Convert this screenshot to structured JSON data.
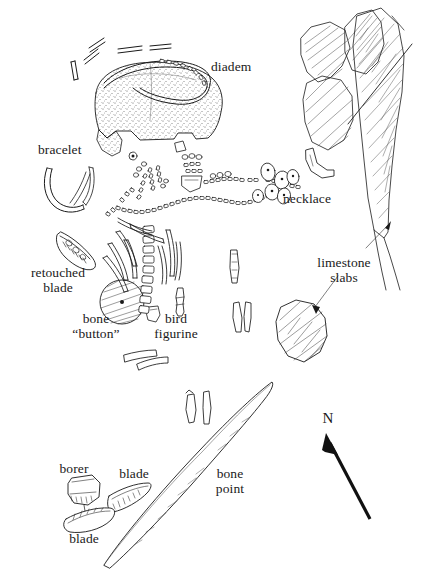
{
  "figure": {
    "type": "archaeological-site-plan",
    "background_color": "#ffffff",
    "ink_color": "#1a1a1a"
  },
  "labels": [
    {
      "id": "diadem",
      "text": "diadem",
      "x": 211,
      "y": 66,
      "align": "left"
    },
    {
      "id": "bracelet",
      "text": "bracelet",
      "x": 38,
      "y": 149,
      "align": "left"
    },
    {
      "id": "necklace",
      "text": "necklace",
      "x": 283,
      "y": 198,
      "align": "left"
    },
    {
      "id": "retouched",
      "text": "retouched\nblade",
      "x": 58,
      "y": 272,
      "align": "center"
    },
    {
      "id": "limestone",
      "text": "limestone\nslabs",
      "x": 344,
      "y": 262,
      "align": "center"
    },
    {
      "id": "bone-button",
      "text": "bone\n“button”",
      "x": 96,
      "y": 318,
      "align": "center"
    },
    {
      "id": "bird",
      "text": "bird\nfigurine",
      "x": 176,
      "y": 318,
      "align": "center"
    },
    {
      "id": "borer",
      "text": "borer",
      "x": 74,
      "y": 468,
      "align": "center"
    },
    {
      "id": "blade-upper",
      "text": "blade",
      "x": 134,
      "y": 473,
      "align": "center"
    },
    {
      "id": "bone-point",
      "text": "bone\npoint",
      "x": 230,
      "y": 473,
      "align": "center"
    },
    {
      "id": "blade-lower",
      "text": "blade",
      "x": 84,
      "y": 538,
      "align": "center"
    },
    {
      "id": "north",
      "text": "N",
      "x": 328,
      "y": 418,
      "align": "center"
    }
  ],
  "features": {
    "cranium": "stippled skull in dorsal view, upper left-centre",
    "diadem_band": "curved bone band arcing over the cranium with beaded right end",
    "necklace_strand": "long sinuous strand of small tubular beads with larger shell pendants at right",
    "vertebral_column": "vertical column of rectangular vertebrae left of centre",
    "ribs": "curved rib shafts fanning left and right of the vertebral column",
    "bone_button": "circular cross-hatched disc with central perforation",
    "bird_figurine": "small narrow carved figurine",
    "bone_point": "long slender bone point running diagonally lower-left to upper-right",
    "limestone_slabs_mass": "large cross-hatched slab masses along right edge",
    "limestone_slab_isolated": "isolated cross-hatched slab at centre-right",
    "north_arrow": "solid arrow pointing up and to the left"
  },
  "leader_lines": [
    {
      "from": "limestone-label",
      "to": "slab-mass-right"
    },
    {
      "from": "limestone-label",
      "to": "slab-isolated"
    }
  ]
}
